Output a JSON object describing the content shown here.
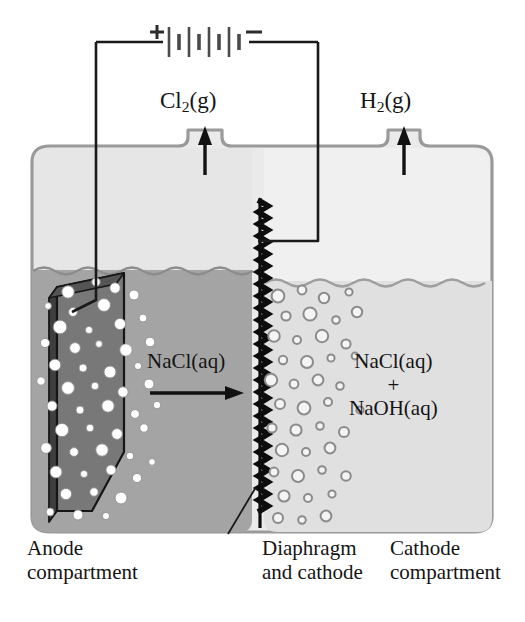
{
  "figure": {
    "colors": {
      "background": "#ffffff",
      "cell_outline": "#9a9a9a",
      "headspace_left": "#e7e7e7",
      "headspace_right": "#efefef",
      "anolyte": "#a3a3a3",
      "catholyte": "#dedede",
      "electrode_face": "#7c7c7c",
      "electrode_edge": "#4a4a4a",
      "electrode_outline": "#1c1c1c",
      "wire": "#1a1a1a",
      "diaphragm": "#0d0d0d",
      "bubble_fill_anode": "#ffffff",
      "bubble_outline_cathode": "#8c8c8c",
      "text": "#141414"
    }
  },
  "circuit": {
    "battery": {
      "name": "battery",
      "positive_terminal": "+",
      "negative_terminal": "−",
      "plate_count": 8
    },
    "left_wire_name": "wire-to-anode",
    "right_wire_name": "wire-to-cathode"
  },
  "gas_outlets": [
    {
      "id": "chlorine",
      "label": "Cl",
      "sub": "2",
      "suffix": "(g)",
      "full": "Cl2(g)",
      "arrow": "up"
    },
    {
      "id": "hydrogen",
      "label": "H",
      "sub": "2",
      "suffix": "(g)",
      "full": "H2(g)",
      "arrow": "up"
    }
  ],
  "solutions": {
    "anode_side": {
      "formula": "NaCl(aq)",
      "flow_arrow": "right"
    },
    "cathode_side": {
      "line1": "NaCl(aq)",
      "plus": "+",
      "line2": "NaOH(aq)"
    }
  },
  "captions": [
    {
      "id": "anode",
      "line1": "Anode",
      "line2": "compartment"
    },
    {
      "id": "diaphragm",
      "line1": "Diaphragm",
      "line2": "and cathode"
    },
    {
      "id": "cathode",
      "line1": "Cathode",
      "line2": "compartment"
    }
  ]
}
